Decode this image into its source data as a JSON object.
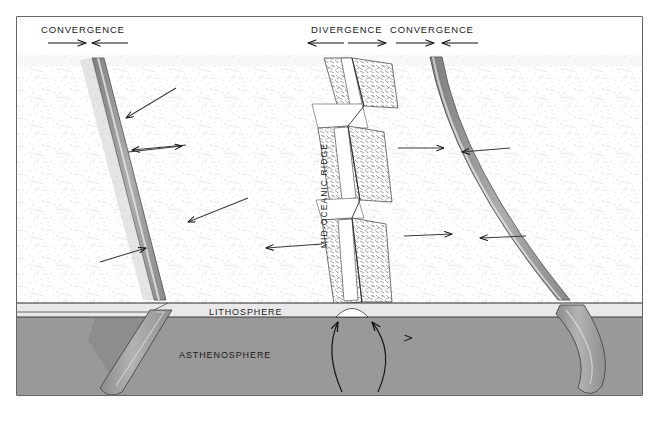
{
  "figure": {
    "frame_color": "#000000",
    "background_color": "#ffffff"
  },
  "labels": {
    "convergence_left": "CONVERGENCE",
    "divergence": "DIVERGENCE",
    "convergence_right": "CONVERGENCE",
    "mid_oceanic_ridge": "MID-OCEANIC RIDGE",
    "lithosphere": "LITHOSPHERE",
    "asthenosphere": "ASTHENOSPHERE"
  },
  "arrow_groups": {
    "convergence_left": {
      "label": "CONVERGENCE",
      "directions": [
        "right",
        "left"
      ],
      "meaning": "plates move toward each other"
    },
    "divergence": {
      "label": "DIVERGENCE",
      "directions": [
        "left",
        "right"
      ],
      "meaning": "plates move apart"
    },
    "convergence_right": {
      "label": "CONVERGENCE",
      "directions": [
        "right",
        "left"
      ],
      "meaning": "plates move toward each other"
    }
  },
  "layers": {
    "lithosphere_color": "#ffffff",
    "asthenosphere_color": "#999999",
    "slab_color": "#a6a6a6",
    "trench_color": "#8f8f8f"
  },
  "features": [
    {
      "name": "left-subduction-zone",
      "type": "convergent boundary"
    },
    {
      "name": "mid-oceanic-ridge",
      "type": "divergent boundary"
    },
    {
      "name": "right-subduction-zone",
      "type": "convergent boundary"
    },
    {
      "name": "mantle-convection-arrows",
      "type": "upwelling"
    }
  ]
}
